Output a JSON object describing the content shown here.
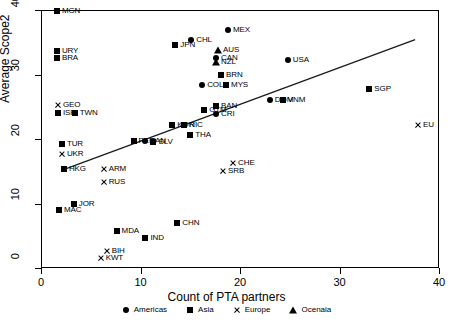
{
  "chart_data": {
    "type": "scatter",
    "title": "",
    "xlabel": "Count of PTA partners",
    "ylabel": "Average Scope2",
    "xlim": [
      0,
      40
    ],
    "ylim": [
      0,
      40
    ],
    "xticks": [
      0,
      10,
      20,
      30,
      40
    ],
    "yticks": [
      0,
      10,
      20,
      30,
      40
    ],
    "grid": false,
    "legend_position": "bottom",
    "legend": [
      {
        "label": "Americas",
        "marker": "circle"
      },
      {
        "label": "Asia",
        "marker": "square"
      },
      {
        "label": "Europe",
        "marker": "cross"
      },
      {
        "label": "Ocenaia",
        "marker": "triangle"
      }
    ],
    "trendline": {
      "x": [
        2.2,
        37.6
      ],
      "y": [
        15.2,
        35.4
      ]
    },
    "points": [
      {
        "label": "MGN",
        "x": 1.6,
        "y": 39.9,
        "group": "Asia",
        "marker": "square"
      },
      {
        "label": "URY",
        "x": 1.6,
        "y": 33.6,
        "group": "Americas",
        "marker": "square"
      },
      {
        "label": "BRA",
        "x": 1.6,
        "y": 32.6,
        "group": "Americas",
        "marker": "square"
      },
      {
        "label": "GEO",
        "x": 1.7,
        "y": 25.2,
        "group": "Europe",
        "marker": "cross"
      },
      {
        "label": "ISR",
        "x": 1.7,
        "y": 24.0,
        "group": "Asia",
        "marker": "square"
      },
      {
        "label": "TWN",
        "x": 3.4,
        "y": 24.0,
        "group": "Asia",
        "marker": "square"
      },
      {
        "label": "TUR",
        "x": 2.1,
        "y": 19.3,
        "group": "Asia",
        "marker": "square"
      },
      {
        "label": "UKR",
        "x": 2.1,
        "y": 17.7,
        "group": "Europe",
        "marker": "cross"
      },
      {
        "label": "HKG",
        "x": 2.3,
        "y": 15.4,
        "group": "Asia",
        "marker": "square"
      },
      {
        "label": "ARM",
        "x": 6.3,
        "y": 15.3,
        "group": "Europe",
        "marker": "cross"
      },
      {
        "label": "RUS",
        "x": 6.3,
        "y": 13.3,
        "group": "Europe",
        "marker": "cross"
      },
      {
        "label": "MAC",
        "x": 1.8,
        "y": 9.0,
        "group": "Asia",
        "marker": "square"
      },
      {
        "label": "JOR",
        "x": 3.3,
        "y": 10.0,
        "group": "Asia",
        "marker": "square"
      },
      {
        "label": "MDA",
        "x": 7.6,
        "y": 5.7,
        "group": "Europe",
        "marker": "square"
      },
      {
        "label": "IND",
        "x": 10.5,
        "y": 4.6,
        "group": "Asia",
        "marker": "square"
      },
      {
        "label": "BIH",
        "x": 6.6,
        "y": 2.7,
        "group": "Europe",
        "marker": "cross"
      },
      {
        "label": "KWT",
        "x": 6.0,
        "y": 1.5,
        "group": "Europe",
        "marker": "cross"
      },
      {
        "label": "CHN",
        "x": 13.7,
        "y": 7.0,
        "group": "Asia",
        "marker": "square"
      },
      {
        "label": "CHE",
        "x": 19.3,
        "y": 16.3,
        "group": "Europe",
        "marker": "cross"
      },
      {
        "label": "SRB",
        "x": 18.3,
        "y": 15.1,
        "group": "Europe",
        "marker": "cross"
      },
      {
        "label": "PER",
        "x": 9.3,
        "y": 19.7,
        "group": "Americas",
        "marker": "square"
      },
      {
        "label": "PAN",
        "x": 10.5,
        "y": 19.7,
        "group": "Americas",
        "marker": "circle"
      },
      {
        "label": "SLV",
        "x": 11.3,
        "y": 19.6,
        "group": "Americas",
        "marker": "square"
      },
      {
        "label": "KOR",
        "x": 13.2,
        "y": 22.2,
        "group": "Asia",
        "marker": "square"
      },
      {
        "label": "NIC",
        "x": 14.4,
        "y": 22.1,
        "group": "Americas",
        "marker": "square"
      },
      {
        "label": "THA",
        "x": 15.0,
        "y": 20.6,
        "group": "Asia",
        "marker": "square"
      },
      {
        "label": "BAN",
        "x": 17.6,
        "y": 25.1,
        "group": "Asia",
        "marker": "square"
      },
      {
        "label": "CRI",
        "x": 17.6,
        "y": 23.8,
        "group": "Americas",
        "marker": "circle"
      },
      {
        "label": "GTM",
        "x": 16.4,
        "y": 24.5,
        "group": "Americas",
        "marker": "square"
      },
      {
        "label": "COL",
        "x": 16.2,
        "y": 28.4,
        "group": "Americas",
        "marker": "circle"
      },
      {
        "label": "MYS",
        "x": 18.6,
        "y": 28.3,
        "group": "Asia",
        "marker": "square"
      },
      {
        "label": "BRN",
        "x": 18.1,
        "y": 30.0,
        "group": "Asia",
        "marker": "square"
      },
      {
        "label": "AUS",
        "x": 17.8,
        "y": 33.8,
        "group": "Ocenaia",
        "marker": "triangle"
      },
      {
        "label": "CAN",
        "x": 17.6,
        "y": 32.6,
        "group": "Americas",
        "marker": "circle"
      },
      {
        "label": "NZL",
        "x": 17.6,
        "y": 31.9,
        "group": "Ocenaia",
        "marker": "triangle"
      },
      {
        "label": "JPN",
        "x": 13.5,
        "y": 34.6,
        "group": "Asia",
        "marker": "square"
      },
      {
        "label": "CHL",
        "x": 15.1,
        "y": 35.4,
        "group": "Americas",
        "marker": "circle"
      },
      {
        "label": "MEX",
        "x": 18.8,
        "y": 36.9,
        "group": "Americas",
        "marker": "circle"
      },
      {
        "label": "USA",
        "x": 24.8,
        "y": 32.2,
        "group": "Americas",
        "marker": "circle"
      },
      {
        "label": "DOM",
        "x": 23.0,
        "y": 26.0,
        "group": "Americas",
        "marker": "circle"
      },
      {
        "label": "VNM",
        "x": 24.3,
        "y": 26.0,
        "group": "Asia",
        "marker": "square"
      },
      {
        "label": "SGP",
        "x": 33.0,
        "y": 27.7,
        "group": "Asia",
        "marker": "square"
      },
      {
        "label": "EU",
        "x": 37.9,
        "y": 22.2,
        "group": "Europe",
        "marker": "cross"
      }
    ]
  }
}
